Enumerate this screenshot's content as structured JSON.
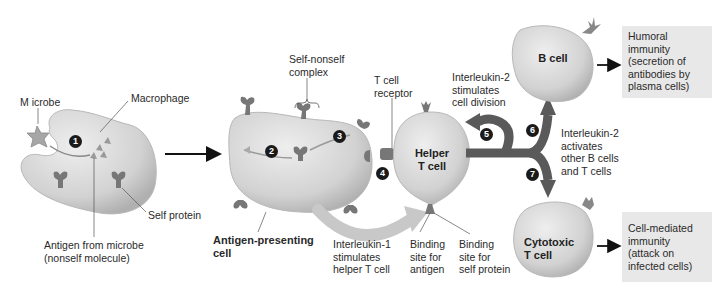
{
  "colors": {
    "cell_fill": "#d9d9d9",
    "cell_shadow": "#b5b5b5",
    "protein": "#7a7a7a",
    "pathway_arrow": "#5a5a5a",
    "interleukin1_arrow": "#c8c8c8",
    "outcome_box": "#e8e8e8",
    "step_badge": "#1a1a1a"
  },
  "labels": {
    "microbe": "M icrobe",
    "macrophage": "Macrophage",
    "self_protein": "Self protein",
    "antigen_from_microbe": "Antigen from microbe\n(nonself molecule)",
    "self_nonself_complex": "Self-nonself\ncomplex",
    "t_cell_receptor": "T cell\nreceptor",
    "antigen_presenting_cell": "Antigen-presenting\ncell",
    "interleukin1": "Interleukin-1\nstimulates\nhelper T cell",
    "binding_site_antigen": "Binding\nsite for\nantigen",
    "binding_site_self": "Binding\nsite for\nself protein",
    "interleukin2_division": "Interleukin-2\nstimulates\ncell division",
    "interleukin2_activates": "Interleukin-2\nactivates\nother B cells\nand T cells"
  },
  "cells": {
    "helper_t": "Helper\nT cell",
    "b_cell": "B cell",
    "cytotoxic_t": "Cytotoxic\nT cell"
  },
  "outcomes": {
    "humoral": "Humoral\nimmunity\n(secretion of\nantibodies by\nplasma cells)",
    "cell_mediated": "Cell-mediated\nimmunity\n(attack on\ninfected cells)"
  },
  "steps": [
    "1",
    "2",
    "3",
    "4",
    "5",
    "6",
    "7"
  ]
}
